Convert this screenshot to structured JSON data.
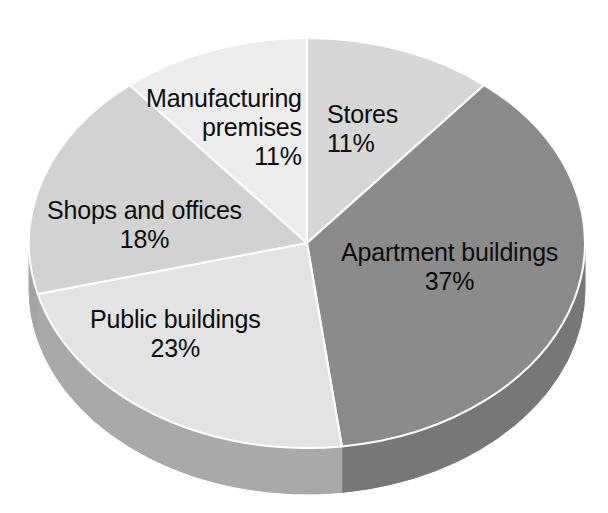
{
  "chart_data": {
    "type": "pie",
    "title": "",
    "subtitle": "",
    "xlabel": "",
    "ylabel": "",
    "grid": false,
    "legend_position": "none",
    "label_format": "name + percent",
    "three_d": true,
    "start_angle_clock": "12 o'clock",
    "direction": "clockwise",
    "unit": "%",
    "total": 100,
    "categories": [
      "Stores",
      "Apartment buildings",
      "Public buildings",
      "Shops and offices",
      "Manufacturing premises"
    ],
    "values": [
      11,
      37,
      23,
      18,
      11
    ],
    "slices": [
      {
        "name": "Stores",
        "value": 11,
        "value_label": "11%",
        "color": "#d7d7d7",
        "side_color": "#b6b6b6"
      },
      {
        "name": "Apartment buildings",
        "value": 37,
        "value_label": "37%",
        "color": "#8b8b8b",
        "side_color": "#777777"
      },
      {
        "name": "Public buildings",
        "value": 23,
        "value_label": "23%",
        "color": "#e3e3e3",
        "side_color": "#a9a9a9"
      },
      {
        "name": "Shops and offices",
        "value": 18,
        "value_label": "18%",
        "color": "#d2d2d2",
        "side_color": "#a4a4a4"
      },
      {
        "name": "Manufacturing premises",
        "value": 11,
        "value_label": "11%",
        "color": "#ededed",
        "side_color": "#bdbdbd"
      }
    ]
  },
  "labels": {
    "manufacturing": {
      "line1": "Manufacturing",
      "line2": "premises",
      "value": "11%"
    },
    "stores": {
      "line1": "Stores",
      "value": "11%"
    },
    "shops": {
      "line1": "Shops and offices",
      "value": "18%"
    },
    "apartment": {
      "line1": "Apartment buildings",
      "value": "37%"
    },
    "public": {
      "line1": "Public buildings",
      "value": "23%"
    }
  },
  "colors": {
    "background": "#ffffff",
    "text": "#0d0d0d",
    "edge": "#ffffff"
  }
}
